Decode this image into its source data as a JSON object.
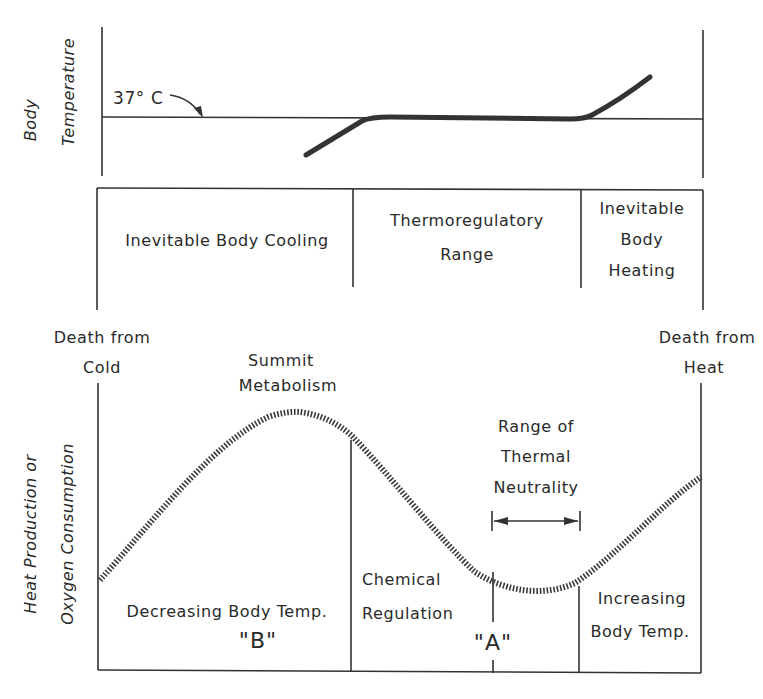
{
  "diagram": {
    "top_panel": {
      "y_axis_label": [
        "Body",
        "Temperature"
      ],
      "reference_label": "37° C",
      "reference_value": "37° C"
    },
    "zones": [
      {
        "id": "cooling",
        "lines": [
          "Inevitable Body Cooling"
        ]
      },
      {
        "id": "thermoregulatory",
        "lines": [
          "Thermoregulatory",
          "Range"
        ]
      },
      {
        "id": "heating",
        "lines": [
          "Inevitable",
          "Body",
          "Heating"
        ]
      }
    ],
    "boundaries": {
      "left": [
        "Death from",
        "Cold"
      ],
      "right": [
        "Death from",
        "Heat"
      ]
    },
    "bottom_panel": {
      "y_axis_label": [
        "Heat Production or",
        "Oxygen Consumption"
      ],
      "summit_label": [
        "Summit",
        "Metabolism"
      ],
      "neutrality_label": [
        "Range of",
        "Thermal",
        "Neutrality"
      ],
      "regions": [
        {
          "id": "decreasing",
          "lines": [
            "Decreasing Body Temp."
          ],
          "marker": "\"B\""
        },
        {
          "id": "chemical",
          "lines": [
            "Chemical",
            "Regulation"
          ],
          "marker": "\"A\""
        },
        {
          "id": "increasing",
          "lines": [
            "Increasing",
            "Body Temp."
          ]
        }
      ]
    },
    "colors": {
      "ink": "#333333",
      "background": "#ffffff"
    }
  }
}
